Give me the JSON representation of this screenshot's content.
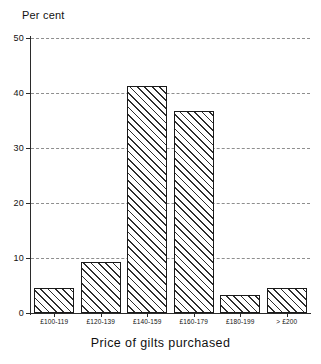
{
  "chart_data": {
    "type": "bar",
    "title": "",
    "subtitle": "",
    "xlabel": "Price of gilts purchased",
    "ylabel": "Per cent",
    "categories": [
      "£100-119",
      "£120-139",
      "£140-159",
      "£160-179",
      "£180-199",
      "> £200"
    ],
    "values": [
      4.6,
      9.2,
      41.3,
      36.7,
      3.2,
      4.6
    ],
    "ylim": [
      0,
      50
    ],
    "ytick_labels": [
      "0",
      "10",
      "20",
      "30",
      "40",
      "50"
    ],
    "ytick_values": [
      0,
      10,
      20,
      30,
      40,
      50
    ],
    "grid": true,
    "grid_style": "dashed",
    "grid_axis": "y",
    "legend": false,
    "legend_position": "none",
    "bar_fill": "diagonal-hatch",
    "bar_edge_color": "#1a1a1a",
    "bar_face_color": "#ffffff",
    "hatch_color": "#2e2e2e",
    "axis_color": "#2b2b2b",
    "grid_color": "#8e8e8e",
    "background_color": "#ffffff"
  },
  "axes": {
    "y_caption": "Per cent",
    "x_title": "Price of gilts purchased"
  }
}
